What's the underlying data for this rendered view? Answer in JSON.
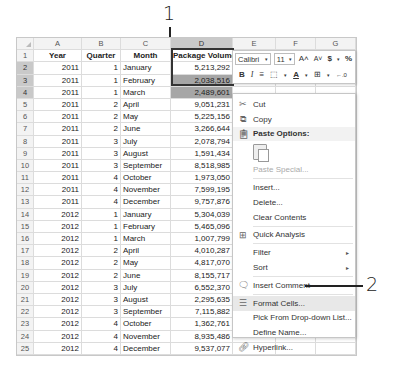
{
  "callouts": [
    {
      "label": "1"
    },
    {
      "label": "2"
    }
  ],
  "sheet": {
    "columns": [
      "A",
      "B",
      "C",
      "D",
      "E",
      "F",
      "G"
    ],
    "header_row": {
      "row": "1",
      "year": "Year",
      "quarter": "Quarter",
      "month": "Month",
      "volume": "Package Volume"
    },
    "rows": [
      {
        "row": "2",
        "year": "2011",
        "quarter": "1",
        "month": "January",
        "volume": "5,213,292"
      },
      {
        "row": "3",
        "year": "2011",
        "quarter": "1",
        "month": "February",
        "volume": "2,038,516"
      },
      {
        "row": "4",
        "year": "2011",
        "quarter": "1",
        "month": "March",
        "volume": "2,489,601"
      },
      {
        "row": "5",
        "year": "2011",
        "quarter": "2",
        "month": "April",
        "volume": "9,051,231"
      },
      {
        "row": "6",
        "year": "2011",
        "quarter": "2",
        "month": "May",
        "volume": "5,225,156"
      },
      {
        "row": "7",
        "year": "2011",
        "quarter": "2",
        "month": "June",
        "volume": "3,266,644"
      },
      {
        "row": "8",
        "year": "2011",
        "quarter": "3",
        "month": "July",
        "volume": "2,078,794"
      },
      {
        "row": "9",
        "year": "2011",
        "quarter": "3",
        "month": "August",
        "volume": "1,591,434"
      },
      {
        "row": "10",
        "year": "2011",
        "quarter": "3",
        "month": "September",
        "volume": "8,518,985"
      },
      {
        "row": "11",
        "year": "2011",
        "quarter": "4",
        "month": "October",
        "volume": "1,973,050"
      },
      {
        "row": "12",
        "year": "2011",
        "quarter": "4",
        "month": "November",
        "volume": "7,599,195"
      },
      {
        "row": "13",
        "year": "2011",
        "quarter": "4",
        "month": "December",
        "volume": "9,757,876"
      },
      {
        "row": "14",
        "year": "2012",
        "quarter": "1",
        "month": "January",
        "volume": "5,304,039"
      },
      {
        "row": "15",
        "year": "2012",
        "quarter": "1",
        "month": "February",
        "volume": "5,465,096"
      },
      {
        "row": "16",
        "year": "2012",
        "quarter": "1",
        "month": "March",
        "volume": "1,007,799"
      },
      {
        "row": "17",
        "year": "2012",
        "quarter": "2",
        "month": "April",
        "volume": "4,010,287"
      },
      {
        "row": "18",
        "year": "2012",
        "quarter": "2",
        "month": "May",
        "volume": "4,817,070"
      },
      {
        "row": "19",
        "year": "2012",
        "quarter": "2",
        "month": "June",
        "volume": "8,155,717"
      },
      {
        "row": "20",
        "year": "2012",
        "quarter": "3",
        "month": "July",
        "volume": "6,552,370"
      },
      {
        "row": "21",
        "year": "2012",
        "quarter": "3",
        "month": "August",
        "volume": "2,295,635"
      },
      {
        "row": "22",
        "year": "2012",
        "quarter": "3",
        "month": "September",
        "volume": "7,115,882"
      },
      {
        "row": "23",
        "year": "2012",
        "quarter": "4",
        "month": "October",
        "volume": "1,362,761"
      },
      {
        "row": "24",
        "year": "2012",
        "quarter": "4",
        "month": "November",
        "volume": "8,935,486"
      },
      {
        "row": "25",
        "year": "2012",
        "quarter": "4",
        "month": "December",
        "volume": "9,537,077"
      }
    ]
  },
  "mini_toolbar": {
    "font_name": "Calibri",
    "font_size": "11",
    "grow_font": "A˄",
    "shrink_font": "A˅",
    "currency": "$",
    "percent": "%",
    "bold": "B",
    "italic": "I",
    "align": "≡",
    "fill": "⬚",
    "font_color": "A",
    "borders": "⊞",
    "increase_decimal": "←.0"
  },
  "context_menu": {
    "items": [
      {
        "label": "Cut",
        "icon": "scissors-icon"
      },
      {
        "label": "Copy",
        "icon": "copy-icon"
      },
      {
        "label": "Paste Options:",
        "icon": "paste-icon"
      },
      {
        "label": "Paste Special..."
      },
      {
        "label": "Insert..."
      },
      {
        "label": "Delete..."
      },
      {
        "label": "Clear Contents"
      },
      {
        "label": "Quick Analysis",
        "icon": "quick-analysis-icon"
      },
      {
        "label": "Filter"
      },
      {
        "label": "Sort"
      },
      {
        "label": "Insert Comment",
        "icon": "comment-icon"
      },
      {
        "label": "Format Cells...",
        "icon": "format-cells-icon"
      },
      {
        "label": "Pick From Drop-down List..."
      },
      {
        "label": "Define Name..."
      },
      {
        "label": "Hyperlink...",
        "icon": "hyperlink-icon"
      }
    ],
    "submenu_arrow": "▸"
  }
}
